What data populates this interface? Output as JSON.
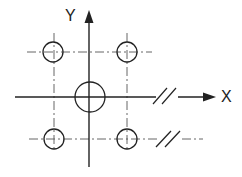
{
  "diagram": {
    "type": "bolt-hole-pattern-coordinate-diagram",
    "axes": {
      "x_label": "X",
      "y_label": "Y"
    },
    "colors": {
      "line": "#222222",
      "centerline": "#555555",
      "background": "#ffffff"
    },
    "center_circle": {
      "cx": 90,
      "cy": 97,
      "r": 15
    },
    "small_circles": [
      {
        "name": "top-left",
        "cx": 53,
        "cy": 52,
        "r": 10
      },
      {
        "name": "top-right",
        "cx": 127,
        "cy": 52,
        "r": 10
      },
      {
        "name": "bottom-left",
        "cx": 54,
        "cy": 139,
        "r": 10
      },
      {
        "name": "bottom-right",
        "cx": 127,
        "cy": 139,
        "r": 10
      }
    ],
    "break_marks": [
      {
        "on": "x-axis",
        "x": 167,
        "y": 97
      },
      {
        "on": "lower-centerline",
        "x": 170,
        "y": 139
      }
    ]
  }
}
